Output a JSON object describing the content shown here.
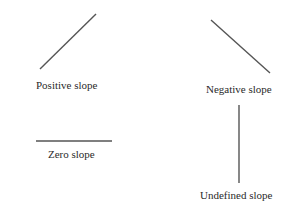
{
  "diagram": {
    "line_color": "#555555",
    "items": [
      {
        "label": "Positive slope",
        "line": {
          "x1": 40,
          "y1": 69,
          "x2": 96,
          "y2": 14
        }
      },
      {
        "label": "Negative slope",
        "line": {
          "x1": 211,
          "y1": 20,
          "x2": 270,
          "y2": 73
        }
      },
      {
        "label": "Zero slope",
        "line": {
          "x1": 36,
          "y1": 141,
          "x2": 112,
          "y2": 141
        }
      },
      {
        "label": "Undefined slope",
        "line": {
          "x1": 239,
          "y1": 105,
          "x2": 239,
          "y2": 183
        }
      }
    ]
  }
}
